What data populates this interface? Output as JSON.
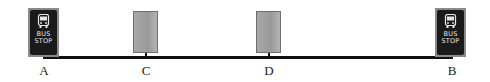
{
  "diagram": {
    "road_color": "#111111",
    "stops": [
      {
        "id": "A",
        "label": "A",
        "kind": "bus-stop",
        "sign_text": [
          "BUS",
          "STOP"
        ]
      },
      {
        "id": "C",
        "label": "C",
        "kind": "building"
      },
      {
        "id": "D",
        "label": "D",
        "kind": "building"
      },
      {
        "id": "B",
        "label": "B",
        "kind": "bus-stop",
        "sign_text": [
          "BUS",
          "STOP"
        ]
      }
    ]
  }
}
